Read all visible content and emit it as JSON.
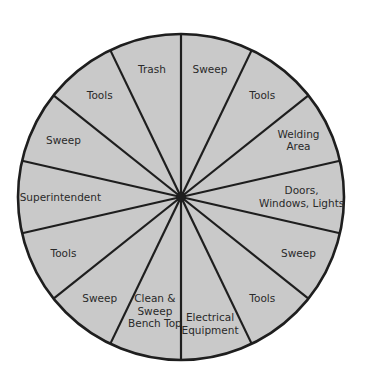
{
  "wheel": {
    "center": [
      181,
      197
    ],
    "radius": 163,
    "fill_color": "#c9c9c9",
    "stroke_color": "#1e1e1e",
    "segment_count": 14,
    "start_angle_deg": 0,
    "segments": [
      {
        "lines": [
          "Sweep"
        ]
      },
      {
        "lines": [
          "Tools"
        ]
      },
      {
        "lines": [
          "Welding",
          "Area"
        ]
      },
      {
        "lines": [
          "Doors,",
          "Windows, Lights"
        ]
      },
      {
        "lines": [
          "Sweep"
        ]
      },
      {
        "lines": [
          "Tools"
        ]
      },
      {
        "lines": [
          "Electrical",
          "Equipment"
        ]
      },
      {
        "lines": [
          "Clean &",
          "Sweep",
          "Bench Top"
        ]
      },
      {
        "lines": [
          "Sweep"
        ]
      },
      {
        "lines": [
          "Tools"
        ]
      },
      {
        "lines": [
          "Superintendent"
        ]
      },
      {
        "lines": [
          "Sweep"
        ]
      },
      {
        "lines": [
          "Tools"
        ]
      },
      {
        "lines": [
          "Trash"
        ]
      }
    ]
  }
}
